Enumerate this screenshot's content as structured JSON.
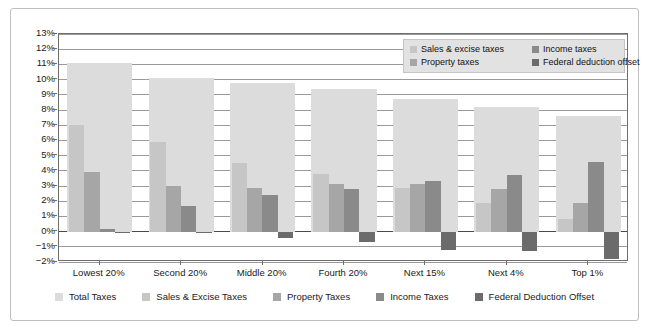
{
  "chart_data": {
    "type": "bar",
    "title": "",
    "xlabel": "",
    "ylabel": "",
    "ylim": [
      -2,
      13
    ],
    "ytick_step": 1,
    "grid": true,
    "legend_position": "inside-top-right and below-axis",
    "categories": [
      "Lowest 20%",
      "Second 20%",
      "Middle 20%",
      "Fourth 20%",
      "Next 15%",
      "Next 4%",
      "Top 1%"
    ],
    "ytick_labels": [
      "13%",
      "12%",
      "11%",
      "10%",
      "9%",
      "8%",
      "7%",
      "6%",
      "5%",
      "4%",
      "3%",
      "2%",
      "1%",
      "0%",
      "-1%",
      "-2%"
    ],
    "ytick_values": [
      13,
      12,
      11,
      10,
      9,
      8,
      7,
      6,
      5,
      4,
      3,
      2,
      1,
      0,
      -1,
      -2
    ],
    "series": [
      {
        "name": "Total Taxes",
        "color": "#dcdcdc",
        "values": [
          11.1,
          10.1,
          9.8,
          9.4,
          8.7,
          8.2,
          7.6
        ]
      },
      {
        "name": "Sales & Excise Taxes",
        "color": "#c6c6c6",
        "values": [
          7.0,
          5.9,
          4.5,
          3.8,
          2.9,
          1.9,
          0.8
        ]
      },
      {
        "name": "Property Taxes",
        "color": "#a6a6a6",
        "values": [
          3.9,
          3.0,
          2.9,
          3.1,
          3.1,
          2.8,
          1.9
        ]
      },
      {
        "name": "Income Taxes",
        "color": "#8a8a8a",
        "values": [
          0.2,
          1.7,
          2.4,
          2.8,
          3.3,
          3.7,
          4.6
        ]
      },
      {
        "name": "Federal Deduction Offset",
        "color": "#6b6b6b",
        "values": [
          -0.03,
          -0.1,
          -0.4,
          -0.7,
          -1.2,
          -1.3,
          -1.8
        ]
      }
    ]
  },
  "inner_legend": {
    "items": [
      {
        "label": "Sales & excise taxes",
        "color": "#c6c6c6",
        "icon": "legend-swatch-icon"
      },
      {
        "label": "Income taxes",
        "color": "#8a8a8a",
        "icon": "legend-swatch-icon"
      },
      {
        "label": "Property taxes",
        "color": "#a6a6a6",
        "icon": "legend-swatch-icon"
      },
      {
        "label": "Federal deduction offset",
        "color": "#6b6b6b",
        "icon": "legend-swatch-icon"
      }
    ]
  },
  "bottom_legend": {
    "items": [
      {
        "label": "Total Taxes",
        "color": "#dcdcdc",
        "icon": "legend-swatch-icon"
      },
      {
        "label": "Sales & Excise Taxes",
        "color": "#c6c6c6",
        "icon": "legend-swatch-icon"
      },
      {
        "label": "Property Taxes",
        "color": "#a6a6a6",
        "icon": "legend-swatch-icon"
      },
      {
        "label": "Income Taxes",
        "color": "#8a8a8a",
        "icon": "legend-swatch-icon"
      },
      {
        "label": "Federal Deduction Offset",
        "color": "#6b6b6b",
        "icon": "legend-swatch-icon"
      }
    ]
  }
}
